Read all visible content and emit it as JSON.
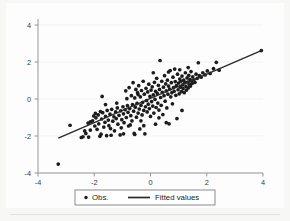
{
  "chart_data": {
    "type": "scatter",
    "title": "",
    "subtitle": "",
    "xlabel": "",
    "ylabel": "",
    "xlim": [
      -4,
      4
    ],
    "ylim": [
      -4,
      4
    ],
    "xticks": [
      -4,
      -2,
      0,
      2,
      4
    ],
    "yticks": [
      -4,
      -2,
      0,
      2,
      4
    ],
    "xtick_labels": [
      "-4",
      "-2",
      "0",
      "2",
      "4"
    ],
    "ytick_labels": [
      "-4",
      "-2",
      "0",
      "2",
      "4"
    ],
    "grid": "horizontal",
    "legend_position": "bottom-outside",
    "marker_color": "#1c1c1c",
    "line_color": "#2a2a2a",
    "background_color": "#fdfdfd",
    "series": [
      {
        "name": "Obs.",
        "type": "scatter",
        "marker": "filled-circle",
        "points": [
          [
            -3.28,
            -3.52
          ],
          [
            -2.86,
            -1.42
          ],
          [
            -2.46,
            -2.08
          ],
          [
            -2.4,
            -2.04
          ],
          [
            -2.34,
            -1.72
          ],
          [
            -2.3,
            -1.86
          ],
          [
            -2.22,
            -1.3
          ],
          [
            -2.14,
            -1.24
          ],
          [
            -2.06,
            -1.18
          ],
          [
            -2.02,
            -0.92
          ],
          [
            -1.98,
            -1.46
          ],
          [
            -1.96,
            -0.78
          ],
          [
            -1.94,
            -1.02
          ],
          [
            -1.9,
            -1.64
          ],
          [
            -1.86,
            -0.86
          ],
          [
            -1.84,
            -1.34
          ],
          [
            -1.8,
            -2.02
          ],
          [
            -1.78,
            -0.68
          ],
          [
            -1.74,
            -1.08
          ],
          [
            -1.72,
            0.14
          ],
          [
            -1.7,
            -0.74
          ],
          [
            -1.66,
            -1.52
          ],
          [
            -1.62,
            -1.26
          ],
          [
            -1.6,
            -0.94
          ],
          [
            -1.56,
            -1.98
          ],
          [
            -1.54,
            -0.62
          ],
          [
            -1.5,
            -1.14
          ],
          [
            -1.48,
            -1.44
          ],
          [
            -1.44,
            -0.82
          ],
          [
            -1.42,
            -1.6
          ],
          [
            -1.38,
            -0.56
          ],
          [
            -1.34,
            -1.2
          ],
          [
            -1.3,
            -0.96
          ],
          [
            -1.28,
            -1.72
          ],
          [
            -1.24,
            -0.7
          ],
          [
            -1.22,
            -1.06
          ],
          [
            -1.18,
            -0.48
          ],
          [
            -1.16,
            -1.36
          ],
          [
            -1.12,
            -0.88
          ],
          [
            -1.08,
            -1.94
          ],
          [
            -1.06,
            -0.64
          ],
          [
            -1.02,
            -1.12
          ],
          [
            -0.98,
            -0.42
          ],
          [
            -0.96,
            -0.8
          ],
          [
            -0.94,
            -1.28
          ],
          [
            -0.9,
            -0.58
          ],
          [
            -0.88,
            0.44
          ],
          [
            -0.86,
            -1.0
          ],
          [
            -0.82,
            -0.36
          ],
          [
            -0.8,
            -0.72
          ],
          [
            -0.78,
            -1.46
          ],
          [
            -0.76,
            0.62
          ],
          [
            -0.74,
            -0.52
          ],
          [
            -0.7,
            -0.9
          ],
          [
            -0.68,
            0.18
          ],
          [
            -0.66,
            -1.18
          ],
          [
            -0.64,
            -0.3
          ],
          [
            -0.62,
            0.88
          ],
          [
            -0.6,
            -0.66
          ],
          [
            -0.58,
            -1.86
          ],
          [
            -0.56,
            0.06
          ],
          [
            -0.54,
            -0.44
          ],
          [
            -0.52,
            0.52
          ],
          [
            -0.5,
            -0.98
          ],
          [
            -0.48,
            -0.24
          ],
          [
            -0.46,
            0.34
          ],
          [
            -0.44,
            -0.76
          ],
          [
            -0.42,
            0.72
          ],
          [
            -0.4,
            -0.54
          ],
          [
            -0.38,
            -1.62
          ],
          [
            -0.36,
            0.12
          ],
          [
            -0.34,
            -0.34
          ],
          [
            -0.32,
            0.46
          ],
          [
            -0.3,
            -0.86
          ],
          [
            -0.28,
            -0.18
          ],
          [
            -0.26,
            0.96
          ],
          [
            -0.24,
            -0.62
          ],
          [
            -0.22,
            0.26
          ],
          [
            -0.2,
            -1.88
          ],
          [
            -0.18,
            -0.42
          ],
          [
            -0.16,
            0.58
          ],
          [
            -0.14,
            -0.08
          ],
          [
            -0.12,
            -0.7
          ],
          [
            -0.1,
            0.38
          ],
          [
            -0.08,
            -0.28
          ],
          [
            -0.06,
            0.8
          ],
          [
            -0.04,
            -0.52
          ],
          [
            -0.02,
            0.14
          ],
          [
            0.0,
            -0.94
          ],
          [
            0.02,
            0.48
          ],
          [
            0.04,
            -0.14
          ],
          [
            0.06,
            0.66
          ],
          [
            0.08,
            -0.38
          ],
          [
            0.1,
            0.22
          ],
          [
            0.12,
            -0.76
          ],
          [
            0.14,
            0.9
          ],
          [
            0.16,
            -0.02
          ],
          [
            0.18,
            0.42
          ],
          [
            0.2,
            -0.46
          ],
          [
            0.22,
            1.12
          ],
          [
            0.24,
            0.3
          ],
          [
            0.26,
            -0.22
          ],
          [
            0.28,
            0.74
          ],
          [
            0.3,
            -0.6
          ],
          [
            0.32,
            0.52
          ],
          [
            0.34,
            2.08
          ],
          [
            0.36,
            0.08
          ],
          [
            0.38,
            -0.34
          ],
          [
            0.4,
            0.96
          ],
          [
            0.42,
            0.36
          ],
          [
            0.44,
            -0.84
          ],
          [
            0.46,
            0.64
          ],
          [
            0.48,
            0.18
          ],
          [
            0.5,
            1.26
          ],
          [
            0.52,
            -0.12
          ],
          [
            0.54,
            0.82
          ],
          [
            0.56,
            0.44
          ],
          [
            0.58,
            -0.48
          ],
          [
            0.6,
            1.02
          ],
          [
            0.62,
            0.26
          ],
          [
            0.64,
            0.7
          ],
          [
            0.66,
            -1.34
          ],
          [
            0.68,
            0.54
          ],
          [
            0.7,
            1.54
          ],
          [
            0.72,
            0.12
          ],
          [
            0.74,
            0.88
          ],
          [
            0.76,
            0.34
          ],
          [
            0.78,
            -0.26
          ],
          [
            0.8,
            1.18
          ],
          [
            0.82,
            0.62
          ],
          [
            0.84,
            0.42
          ],
          [
            0.86,
            1.62
          ],
          [
            0.88,
            0.94
          ],
          [
            0.9,
            0.2
          ],
          [
            0.92,
            0.72
          ],
          [
            0.94,
            -1.06
          ],
          [
            0.96,
            1.34
          ],
          [
            0.98,
            0.5
          ],
          [
            1.0,
            0.86
          ],
          [
            1.02,
            0.28
          ],
          [
            1.04,
            1.08
          ],
          [
            1.06,
            0.64
          ],
          [
            1.08,
            0.96
          ],
          [
            1.1,
            0.4
          ],
          [
            1.12,
            1.24
          ],
          [
            1.14,
            0.76
          ],
          [
            1.16,
            0.56
          ],
          [
            1.18,
            1.02
          ],
          [
            1.2,
            0.34
          ],
          [
            1.22,
            0.88
          ],
          [
            1.24,
            1.42
          ],
          [
            1.26,
            0.68
          ],
          [
            1.28,
            0.48
          ],
          [
            1.3,
            1.14
          ],
          [
            1.32,
            0.92
          ],
          [
            1.34,
            0.6
          ],
          [
            1.36,
            1.28
          ],
          [
            1.38,
            0.8
          ],
          [
            1.4,
            1.06
          ],
          [
            1.42,
            0.7
          ],
          [
            1.44,
            1.48
          ],
          [
            1.46,
            0.98
          ],
          [
            1.48,
            0.84
          ],
          [
            1.5,
            1.2
          ],
          [
            1.54,
            1.04
          ],
          [
            1.58,
            0.9
          ],
          [
            1.62,
            1.34
          ],
          [
            1.66,
            1.12
          ],
          [
            1.7,
            1.96
          ],
          [
            1.74,
            1.26
          ],
          [
            1.8,
            1.18
          ],
          [
            1.86,
            1.42
          ],
          [
            1.94,
            1.3
          ],
          [
            2.02,
            1.52
          ],
          [
            2.12,
            1.38
          ],
          [
            2.24,
            1.64
          ],
          [
            2.34,
            1.98
          ],
          [
            2.44,
            1.56
          ],
          [
            3.94,
            2.62
          ],
          [
            -2.2,
            -2.06
          ],
          [
            -1.76,
            -1.9
          ],
          [
            -1.4,
            -1.96
          ],
          [
            -0.96,
            -1.88
          ],
          [
            -0.56,
            -1.92
          ],
          [
            -1.04,
            -1.56
          ],
          [
            -0.72,
            -1.4
          ],
          [
            -0.24,
            -1.44
          ],
          [
            0.18,
            -1.36
          ],
          [
            0.56,
            -1.28
          ],
          [
            -1.6,
            -0.3
          ],
          [
            -1.2,
            -0.22
          ],
          [
            -0.84,
            0.02
          ],
          [
            -0.44,
            0.24
          ],
          [
            0.1,
            1.42
          ],
          [
            0.64,
            1.46
          ],
          [
            1.04,
            1.58
          ],
          [
            1.34,
            1.7
          ],
          [
            -2.14,
            -1.68
          ],
          [
            -0.34,
            -1.18
          ],
          [
            0.3,
            -1.02
          ],
          [
            1.12,
            -0.62
          ]
        ]
      },
      {
        "name": "Fitted values",
        "type": "line",
        "endpoints": [
          [
            -3.28,
            -2.12
          ],
          [
            3.94,
            2.62
          ]
        ],
        "slope": 0.657,
        "intercept": 0.043
      }
    ],
    "legend": [
      {
        "label": "Obs.",
        "marker": "filled-circle"
      },
      {
        "label": "Fitted values",
        "marker": "line"
      }
    ]
  },
  "legend": {
    "obs_label": "Obs.",
    "fitted_label": "Fitted values"
  },
  "axes": {
    "y_labels": [
      "4",
      "2",
      "0",
      "-2",
      "-4"
    ],
    "x_labels": [
      "-4",
      "-2",
      "0",
      "2",
      "4"
    ]
  }
}
